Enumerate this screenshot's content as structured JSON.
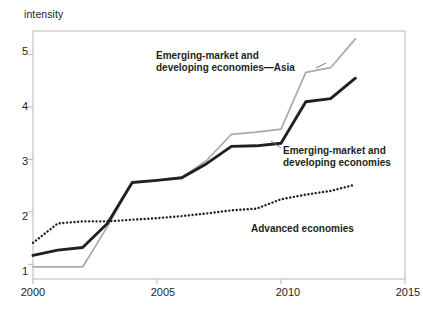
{
  "chart_data": {
    "type": "line",
    "title": "",
    "subtitle": "",
    "xlabel": "",
    "ylabel": "intensity",
    "xlim": [
      2000,
      2015
    ],
    "ylim": [
      0.72,
      5.45
    ],
    "grid": false,
    "legend_position": "inline-annotations",
    "xticks": [
      2000,
      2005,
      2010,
      2015
    ],
    "xtick_labels": [
      "2000",
      "2005",
      "2010",
      "2015"
    ],
    "yticks": [
      1,
      2,
      3,
      4,
      5
    ],
    "ytick_labels": [
      "1",
      "2",
      "3",
      "4",
      "5"
    ],
    "x": [
      2000,
      2001,
      2002,
      2003,
      2004,
      2005,
      2006,
      2007,
      2008,
      2009,
      2010,
      2011,
      2012,
      2013
    ],
    "series": [
      {
        "name": "Emerging-market and developing economies—Asia",
        "style": "solid-light",
        "color": "#a7a9ac",
        "values": [
          0.95,
          0.95,
          0.95,
          1.72,
          2.56,
          2.6,
          2.66,
          2.98,
          3.48,
          3.52,
          3.58,
          4.66,
          4.75,
          5.3
        ]
      },
      {
        "name": "Emerging-market and developing economies",
        "style": "solid-dark",
        "color": "#231f20",
        "values": [
          1.17,
          1.27,
          1.32,
          1.78,
          2.56,
          2.6,
          2.65,
          2.92,
          3.25,
          3.26,
          3.31,
          4.1,
          4.16,
          4.55
        ]
      },
      {
        "name": "Advanced economies",
        "style": "dotted",
        "color": "#231f20",
        "values": [
          1.41,
          1.78,
          1.82,
          1.82,
          1.85,
          1.88,
          1.92,
          1.97,
          2.03,
          2.06,
          2.24,
          2.33,
          2.4,
          2.52
        ]
      }
    ],
    "annotations": [
      {
        "id": "annot-emde-asia",
        "lines": [
          "Emerging-market and",
          "developing economies—Asia"
        ],
        "target_series": "Emerging-market and developing economies—Asia"
      },
      {
        "id": "annot-emde",
        "lines": [
          "Emerging-market and",
          "developing economies"
        ],
        "target_series": "Emerging-market and developing economies"
      },
      {
        "id": "annot-advanced",
        "lines": [
          "Advanced economies"
        ],
        "target_series": "Advanced economies"
      }
    ]
  },
  "axis": {
    "y_label_text": "intensity",
    "y_tick_1": "1",
    "y_tick_2": "2",
    "y_tick_3": "3",
    "y_tick_4": "4",
    "y_tick_5": "5",
    "x_tick_2000": "2000",
    "x_tick_2005": "2005",
    "x_tick_2010": "2010",
    "x_tick_2015": "2015"
  },
  "annotations": {
    "asia_line1": "Emerging-market and",
    "asia_line2": "developing economies—Asia",
    "emde_line1": "Emerging-market and",
    "emde_line2": "developing economies",
    "advanced_line1": "Advanced economies"
  },
  "colors": {
    "frame": "#b5b7b9",
    "dark_series": "#231f20",
    "light_series": "#a7a9ac",
    "text": "#231f20",
    "background": "#ffffff"
  }
}
